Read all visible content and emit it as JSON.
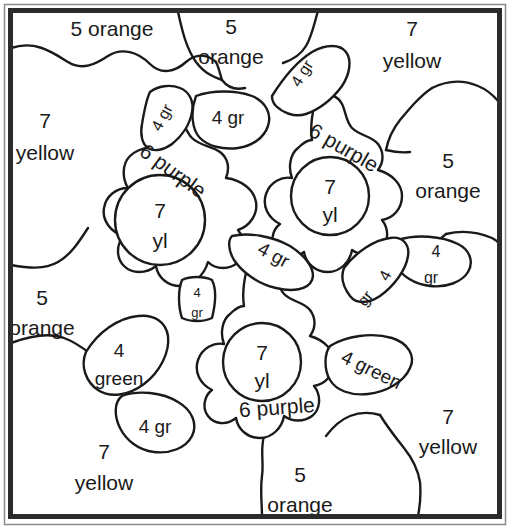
{
  "page": {
    "type": "coloring-worksheet",
    "width": 510,
    "height": 531,
    "background_color": "#ffffff",
    "line_color": "#1a1a1a",
    "frame_color": "#2b2b2b"
  },
  "legend_colors": {
    "yellow": "#ffd700",
    "orange": "#ff8c00",
    "purple": "#800080",
    "green": "#228b22"
  },
  "regions": [
    {
      "id": "bg-top-left",
      "number": "5",
      "color_word": "orange",
      "label": "5 orange",
      "line1": "5",
      "line2": "orange",
      "x": 112,
      "y": 30,
      "size": "lg",
      "rotate": 0,
      "single_line": true
    },
    {
      "id": "bg-top-mid",
      "number": "5",
      "color_word": "orange",
      "label": "5 orange",
      "line1": "5",
      "line2": "orange",
      "x": 231,
      "y": 28,
      "size": "lg",
      "rotate": 0,
      "single_line": false
    },
    {
      "id": "bg-top-right",
      "number": "7",
      "color_word": "yellow",
      "label": "7 yellow",
      "line1": "7",
      "line2": "yellow",
      "x": 412,
      "y": 30,
      "size": "lg",
      "rotate": 0,
      "single_line": false
    },
    {
      "id": "bg-left-upper",
      "number": "7",
      "color_word": "yellow",
      "label": "7 yellow",
      "line1": "7",
      "line2": "yellow",
      "x": 45,
      "y": 122,
      "size": "lg",
      "rotate": 0,
      "single_line": false
    },
    {
      "id": "bg-right-mid",
      "number": "5",
      "color_word": "orange",
      "label": "5 orange",
      "line1": "5",
      "line2": "orange",
      "x": 448,
      "y": 162,
      "size": "lg",
      "rotate": 0,
      "single_line": false
    },
    {
      "id": "bg-left-lower",
      "number": "5",
      "color_word": "orange",
      "label": "5 orange",
      "line1": "5",
      "line2": "orange",
      "x": 42,
      "y": 299,
      "size": "lg",
      "rotate": 0,
      "single_line": false
    },
    {
      "id": "bg-bottom-left",
      "number": "7",
      "color_word": "yellow",
      "label": "7 yellow",
      "line1": "7",
      "line2": "yellow",
      "x": 104,
      "y": 453,
      "size": "lg",
      "rotate": 0,
      "single_line": false
    },
    {
      "id": "bg-bottom-mid",
      "number": "5",
      "color_word": "orange",
      "label": "5 orange",
      "line1": "5",
      "line2": "orange",
      "x": 300,
      "y": 476,
      "size": "lg",
      "rotate": 0,
      "single_line": false
    },
    {
      "id": "bg-bottom-right",
      "number": "7",
      "color_word": "yellow",
      "label": "7 yellow",
      "line1": "7",
      "line2": "yellow",
      "x": 448,
      "y": 418,
      "size": "lg",
      "rotate": 0,
      "single_line": false
    }
  ],
  "flowers": [
    {
      "id": "flower-left",
      "center": {
        "number": "7",
        "color_word": "yl",
        "line1": "7",
        "line2": "yl",
        "cx": 160,
        "cy": 220,
        "r": 45
      },
      "petal_label": {
        "text": "6 purple",
        "x": 172,
        "y": 172,
        "rotate": 36
      }
    },
    {
      "id": "flower-right",
      "center": {
        "number": "7",
        "color_word": "yl",
        "line1": "7",
        "line2": "yl",
        "cx": 330,
        "cy": 196,
        "r": 39
      },
      "petal_label": {
        "text": "6 purple",
        "x": 343,
        "y": 149,
        "rotate": 30
      }
    },
    {
      "id": "flower-bottom",
      "center": {
        "number": "7",
        "color_word": "yl",
        "line1": "7",
        "line2": "yl",
        "cx": 262,
        "cy": 362,
        "r": 39
      },
      "petal_label": {
        "text": "6 purple",
        "x": 277,
        "y": 409,
        "rotate": -4
      }
    }
  ],
  "leaves": [
    {
      "id": "leaf-top-left-upright",
      "label": "4 gr",
      "x": 163,
      "y": 118,
      "size": "sm",
      "rotate": -62
    },
    {
      "id": "leaf-top-center",
      "label": "4 gr",
      "x": 228,
      "y": 119,
      "size": "md",
      "rotate": 0
    },
    {
      "id": "leaf-top-right",
      "label": "4 gr",
      "x": 303,
      "y": 74,
      "size": "sm",
      "rotate": -58
    },
    {
      "id": "leaf-mid-center",
      "label": "4 gr",
      "x": 273,
      "y": 256,
      "size": "md",
      "rotate": 28
    },
    {
      "id": "leaf-small-left",
      "label-line1": "4",
      "label-line2": "gr",
      "label": "4 gr",
      "x": 197,
      "y": 302,
      "size": "xs",
      "rotate": 0,
      "stacked": true
    },
    {
      "id": "leaf-right-lower",
      "label-line1": "4",
      "label-line2": "gr",
      "label": "4 gr",
      "x": 434,
      "y": 268,
      "size": "sm",
      "rotate": 0,
      "stacked": true
    },
    {
      "id": "leaf-right-slant",
      "label": "4",
      "label2": "gr",
      "x": 381,
      "y": 288,
      "size": "sm",
      "rotate": -52,
      "stacked": true
    },
    {
      "id": "leaf-left-green",
      "label-line1": "4",
      "label-line2": "green",
      "label": "4 green",
      "x": 119,
      "y": 363,
      "size": "md",
      "rotate": 0,
      "stacked": true
    },
    {
      "id": "leaf-left-lower-gr",
      "label": "4 gr",
      "x": 155,
      "y": 428,
      "size": "md",
      "rotate": 0
    },
    {
      "id": "leaf-right-green",
      "label": "4 green",
      "x": 371,
      "y": 371,
      "size": "md",
      "rotate": 26
    }
  ]
}
